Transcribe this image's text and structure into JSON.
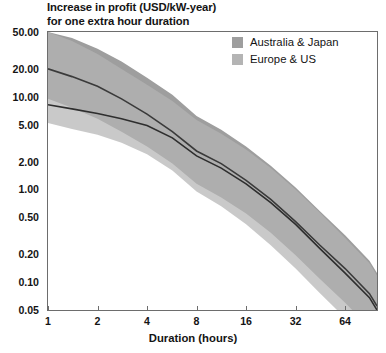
{
  "chart_data": {
    "type": "area",
    "title": "Increase in profit (USD/kW-year)\nfor one extra hour duration",
    "xlabel": "Duration (hours)",
    "ylabel": "",
    "xscale": "log2",
    "yscale": "log10",
    "xlim": [
      1,
      100
    ],
    "ylim": [
      0.05,
      50
    ],
    "grid": false,
    "legend_position": "top-right",
    "xticks": [
      1,
      2,
      4,
      8,
      16,
      32,
      64
    ],
    "xtick_labels": [
      "1",
      "2",
      "4",
      "8",
      "16",
      "32",
      "64"
    ],
    "yticks": [
      50,
      20,
      10,
      5,
      2,
      1,
      0.5,
      0.2,
      0.1,
      0.05
    ],
    "ytick_labels": [
      "50.00",
      "20.00",
      "10.00",
      "5.00",
      "2.00",
      "1.00",
      "0.50",
      "0.20",
      "0.10",
      "0.05"
    ],
    "x": [
      1,
      1.4,
      2,
      2.8,
      4,
      5.7,
      8,
      11.3,
      16,
      22.6,
      32,
      45,
      64,
      90,
      100
    ],
    "series": [
      {
        "name": "Australia & Japan",
        "color": "#9e9e9e",
        "line_color": "#3a3a3a",
        "median": [
          20.0,
          16.5,
          13.0,
          9.5,
          6.5,
          4.2,
          2.6,
          1.9,
          1.25,
          0.78,
          0.45,
          0.25,
          0.14,
          0.075,
          0.055
        ],
        "upper": [
          50.0,
          43.0,
          33.0,
          24.0,
          16.0,
          10.5,
          6.2,
          4.4,
          2.9,
          1.8,
          1.05,
          0.58,
          0.32,
          0.17,
          0.125
        ],
        "lower": [
          9.5,
          7.6,
          5.8,
          4.2,
          2.9,
          1.9,
          1.15,
          0.82,
          0.55,
          0.34,
          0.195,
          0.108,
          0.06,
          0.032,
          0.024
        ]
      },
      {
        "name": "Europe & US",
        "color": "#b4b4b4",
        "line_color": "#2e2e2e",
        "median": [
          8.2,
          7.4,
          6.6,
          5.8,
          4.9,
          3.6,
          2.3,
          1.7,
          1.15,
          0.72,
          0.42,
          0.23,
          0.125,
          0.068,
          0.05
        ],
        "upper": [
          50.0,
          40.0,
          29.0,
          20.0,
          13.5,
          9.0,
          5.6,
          4.0,
          2.7,
          1.7,
          1.0,
          0.56,
          0.3,
          0.16,
          0.118
        ],
        "lower": [
          5.2,
          4.5,
          3.9,
          3.2,
          2.4,
          1.6,
          0.95,
          0.66,
          0.42,
          0.25,
          0.14,
          0.076,
          0.041,
          0.021,
          0.016
        ]
      }
    ]
  },
  "legend": {
    "items": [
      {
        "label": "Australia & Japan",
        "color": "#9e9e9e"
      },
      {
        "label": "Europe & US",
        "color": "#b4b4b4"
      }
    ]
  }
}
